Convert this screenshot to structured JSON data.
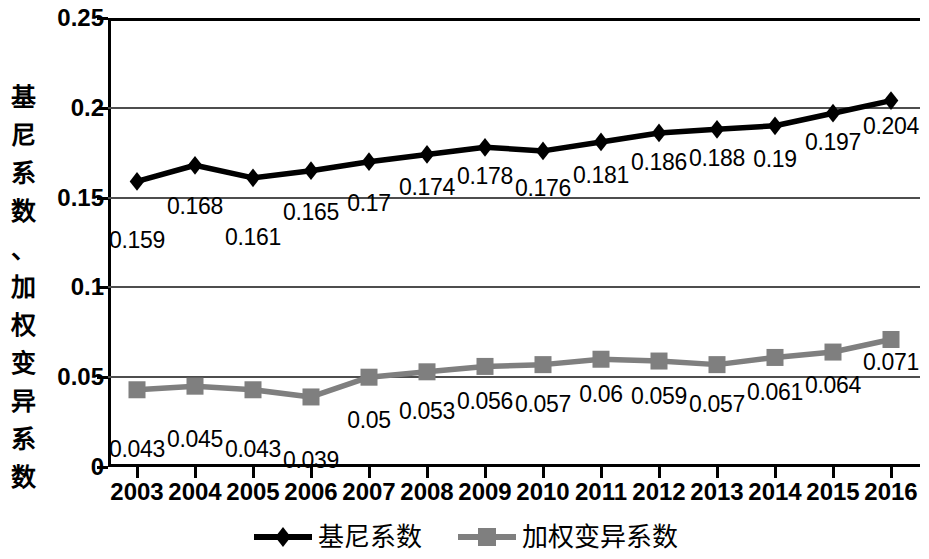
{
  "chart_data": {
    "type": "line",
    "title": "",
    "xlabel": "",
    "ylabel": "基尼系数、加权变异系数",
    "ylabel_chars": [
      "基",
      "尼",
      "系",
      "数",
      "、",
      "加",
      "权",
      "变",
      "异",
      "系",
      "数"
    ],
    "categories": [
      "2003",
      "2004",
      "2005",
      "2006",
      "2007",
      "2008",
      "2009",
      "2010",
      "2011",
      "2012",
      "2013",
      "2014",
      "2015",
      "2016"
    ],
    "ylim": [
      0,
      0.25
    ],
    "yticks": [
      "0",
      "0.05",
      "0.1",
      "0.15",
      "0.2",
      "0.25"
    ],
    "ytick_values": [
      0,
      0.05,
      0.1,
      0.15,
      0.2,
      0.25
    ],
    "grid": true,
    "legend_position": "bottom",
    "series": [
      {
        "name": "基尼系数",
        "marker": "diamond",
        "color": "#000000",
        "values": [
          0.159,
          0.168,
          0.161,
          0.165,
          0.17,
          0.174,
          0.178,
          0.176,
          0.181,
          0.186,
          0.188,
          0.19,
          0.197,
          0.204
        ],
        "labels": [
          "0.159",
          "0.168",
          "0.161",
          "0.165",
          "0.17",
          "0.174",
          "0.178",
          "0.176",
          "0.181",
          "0.186",
          "0.188",
          "0.19",
          "0.197",
          "0.204"
        ]
      },
      {
        "name": "加权变异系数",
        "marker": "square",
        "color": "#7f7f7f",
        "values": [
          0.043,
          0.045,
          0.043,
          0.039,
          0.05,
          0.053,
          0.056,
          0.057,
          0.06,
          0.059,
          0.057,
          0.061,
          0.064,
          0.071
        ],
        "labels": [
          "0.043",
          "0.045",
          "0.043",
          "0.039",
          "0.05",
          "0.053",
          "0.056",
          "0.057",
          "0.06",
          "0.059",
          "0.057",
          "0.061",
          "0.064",
          "0.071"
        ]
      }
    ]
  },
  "legend": {
    "items": [
      {
        "label": "基尼系数",
        "color": "#000000",
        "marker": "diamond"
      },
      {
        "label": "加权变异系数",
        "color": "#7f7f7f",
        "marker": "square"
      }
    ]
  }
}
